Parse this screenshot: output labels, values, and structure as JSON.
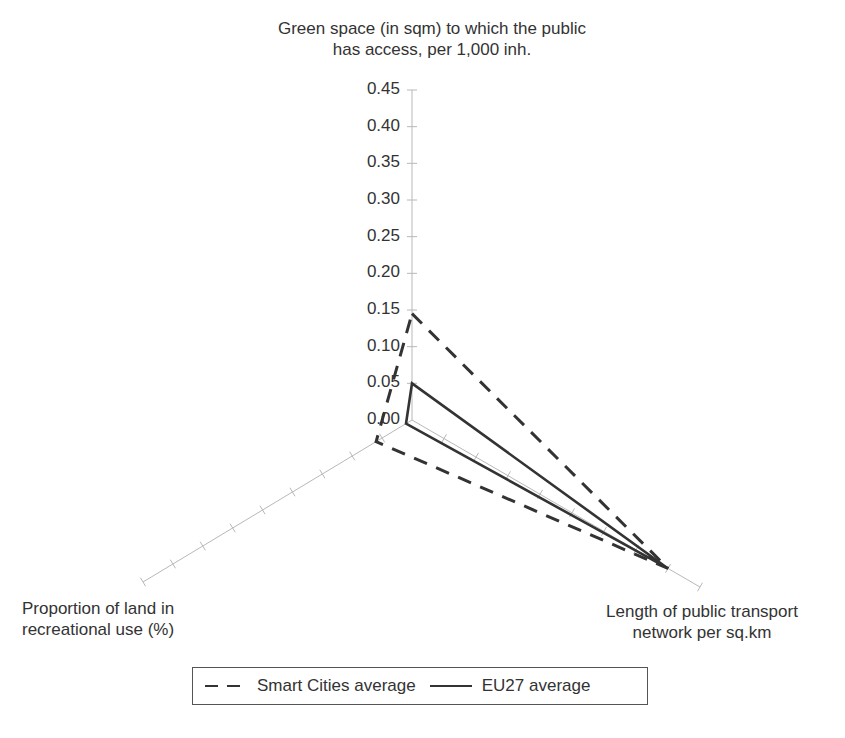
{
  "chart_data": {
    "type": "radar",
    "title": "",
    "axes": [
      {
        "id": "green",
        "label_lines": [
          "Green space (in sqm) to which the public",
          "has access, per 1,000 inh."
        ]
      },
      {
        "id": "transport",
        "label_lines": [
          "Length of public transport",
          "network per sq.km"
        ]
      },
      {
        "id": "recreational",
        "label_lines": [
          "Proportion of land in",
          "recreational use (%)"
        ]
      }
    ],
    "categories": [
      "Green space (in sqm) to which the public has access, per 1,000 inh.",
      "Length of public transport network per sq.km",
      "Proportion of land in recreational use (%)"
    ],
    "radial_ticks": [
      "0.00",
      "0.05",
      "0.10",
      "0.15",
      "0.20",
      "0.25",
      "0.30",
      "0.35",
      "0.40",
      "0.45"
    ],
    "rlim": [
      0,
      0.45
    ],
    "grid": false,
    "legend_position": "bottom",
    "series": [
      {
        "name": "Smart Cities average",
        "style": "dashed",
        "values": [
          0.145,
          0.4,
          0.06
        ]
      },
      {
        "name": "EU27 average",
        "style": "solid",
        "values": [
          0.05,
          0.4,
          0.01
        ]
      }
    ],
    "colors": {
      "series": "#333333",
      "axis": "#b8b8b8",
      "text": "#333333"
    }
  },
  "labels": {
    "top_line1": "Green space (in sqm) to which the public",
    "top_line2": "has access, per 1,000 inh.",
    "left_line1": "Proportion of land in",
    "left_line2": "recreational use (%)",
    "right_line1": "Length of public transport",
    "right_line2": "network per sq.km"
  },
  "legend": {
    "smart_cities": "Smart Cities average",
    "eu27": "EU27 average"
  }
}
